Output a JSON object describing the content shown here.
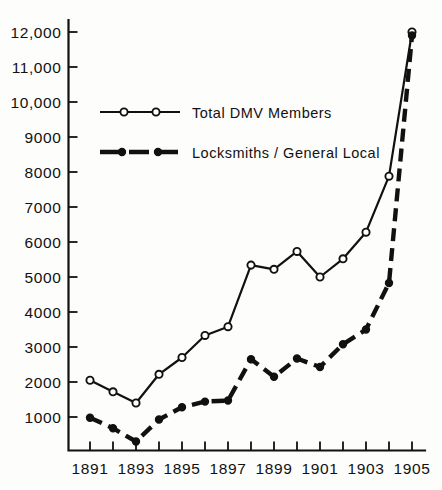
{
  "chart_data": {
    "type": "line",
    "title": "",
    "subtitle": "",
    "xlabel": "",
    "ylabel": "",
    "grid": false,
    "legend_position": "upper-left-inside",
    "x": [
      1891,
      1892,
      1893,
      1894,
      1895,
      1896,
      1897,
      1898,
      1899,
      1900,
      1901,
      1902,
      1903,
      1904,
      1905
    ],
    "xlim": [
      1891,
      1905
    ],
    "ylim": [
      0,
      12000
    ],
    "x_tick_values": [
      1891,
      1892,
      1893,
      1894,
      1895,
      1896,
      1897,
      1898,
      1899,
      1900,
      1901,
      1902,
      1903,
      1904,
      1905
    ],
    "x_tick_labels": [
      "1891",
      "",
      "1893",
      "",
      "1895",
      "",
      "1897",
      "",
      "1899",
      "",
      "1901",
      "",
      "1903",
      "",
      "1905"
    ],
    "y_tick_values": [
      1000,
      2000,
      3000,
      4000,
      5000,
      6000,
      7000,
      8000,
      9000,
      10000,
      11000,
      12000
    ],
    "y_tick_labels": [
      "1000",
      "2000",
      "3000",
      "4000",
      "5000",
      "6000",
      "7000",
      "8000",
      "9000",
      "10,000",
      "11,000",
      "12,000"
    ],
    "series": [
      {
        "name": "Total DMV Members",
        "marker": "open-circle",
        "line_style": "solid",
        "color": "#111111",
        "values": [
          2050,
          1720,
          1400,
          2220,
          2700,
          3330,
          3580,
          5340,
          5220,
          5730,
          5000,
          5520,
          6280,
          7880,
          12000
        ]
      },
      {
        "name": "Locksmiths / General Local",
        "marker": "filled-circle",
        "line_style": "dashed",
        "color": "#111111",
        "values": [
          980,
          680,
          300,
          930,
          1280,
          1440,
          1470,
          2650,
          2150,
          2670,
          2430,
          3080,
          3500,
          4830,
          11900
        ]
      }
    ]
  },
  "legend": {
    "entries": [
      {
        "label": "Total DMV Members",
        "style": "solid-open-circle"
      },
      {
        "label": "Locksmiths / General Local",
        "style": "dashed-filled-circle"
      }
    ]
  },
  "colors": {
    "ink": "#111111",
    "paper": "#fdfdfc"
  }
}
